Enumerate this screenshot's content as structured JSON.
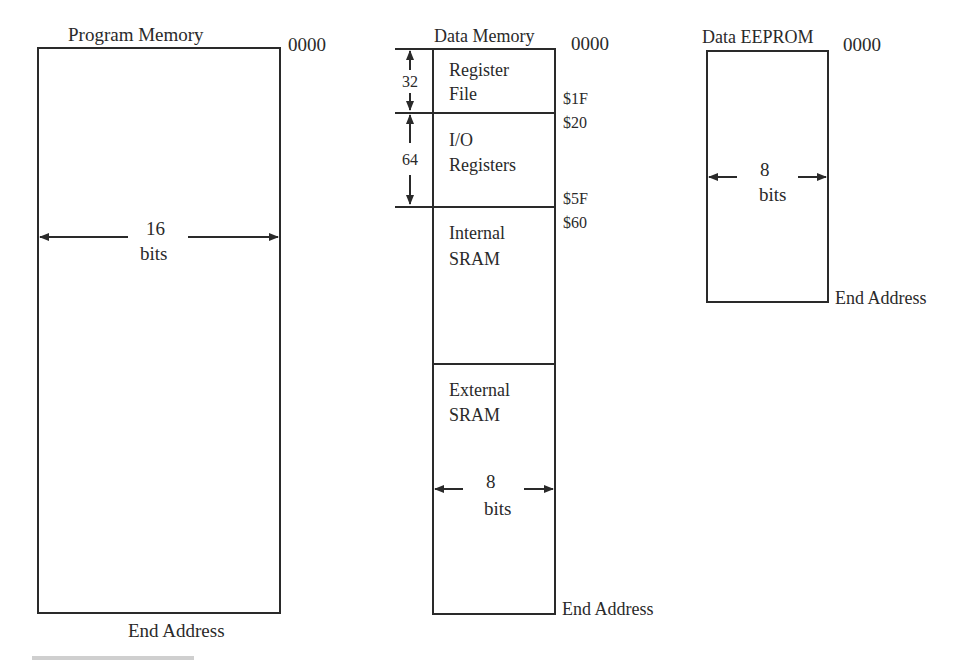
{
  "program_memory": {
    "title": "Program Memory",
    "start_address": "0000",
    "end_address": "End Address",
    "width_value": "16",
    "width_unit": "bits"
  },
  "data_memory": {
    "title": "Data Memory",
    "start_address": "0000",
    "end_address": "End Address",
    "sections": [
      {
        "line1": "Register",
        "line2": "File",
        "size": "32",
        "end": "$1F"
      },
      {
        "line1": "I/O",
        "line2": "Registers",
        "size": "64",
        "start": "$20",
        "end": "$5F"
      },
      {
        "line1": "Internal",
        "line2": "SRAM",
        "start": "$60"
      },
      {
        "line1": "External",
        "line2": "SRAM"
      }
    ],
    "width_value": "8",
    "width_unit": "bits"
  },
  "data_eeprom": {
    "title": "Data EEPROM",
    "start_address": "0000",
    "end_address": "End Address",
    "width_value": "8",
    "width_unit": "bits"
  }
}
